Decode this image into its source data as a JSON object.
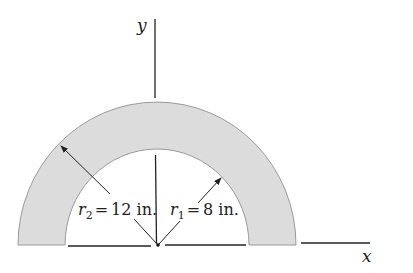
{
  "figure": {
    "type": "semicircular-ring-cross-section",
    "axes": {
      "x_label": "x",
      "y_label": "y"
    },
    "dimensions": {
      "outer": {
        "symbol": "r",
        "subscript": "2",
        "equals": "=",
        "value": "12 in."
      },
      "inner": {
        "symbol": "r",
        "subscript": "1",
        "equals": "=",
        "value": "8 in."
      }
    },
    "colors": {
      "ring_fill": "#dcdcdc",
      "ring_stroke": "#9a9a9a",
      "line": "#222222"
    }
  }
}
